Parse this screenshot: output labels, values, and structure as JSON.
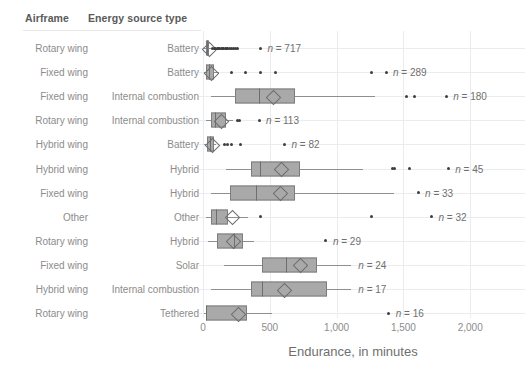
{
  "header": {
    "airframe_label": "Airframe",
    "energy_label": "Energy source type"
  },
  "axis": {
    "xlabel": "Endurance, in minutes",
    "ticks": [
      "0",
      "500",
      "1,000",
      "1,500",
      "2,000"
    ]
  },
  "rows": [
    {
      "airframe": "Rotary wing",
      "energy": "Battery",
      "n_label": "n = 717"
    },
    {
      "airframe": "Fixed wing",
      "energy": "Battery",
      "n_label": "n = 289"
    },
    {
      "airframe": "Fixed wing",
      "energy": "Internal combustion",
      "n_label": "n = 180"
    },
    {
      "airframe": "Rotary wing",
      "energy": "Internal combustion",
      "n_label": "n = 113"
    },
    {
      "airframe": "Hybrid wing",
      "energy": "Battery",
      "n_label": "n = 82"
    },
    {
      "airframe": "Hybrid wing",
      "energy": "Hybrid",
      "n_label": "n = 45"
    },
    {
      "airframe": "Fixed wing",
      "energy": "Hybrid",
      "n_label": "n = 33"
    },
    {
      "airframe": "Other",
      "energy": "Other",
      "n_label": "n = 32"
    },
    {
      "airframe": "Rotary wing",
      "energy": "Hybrid",
      "n_label": "n = 29"
    },
    {
      "airframe": "Fixed wing",
      "energy": "Solar",
      "n_label": "n = 24"
    },
    {
      "airframe": "Hybrid wing",
      "energy": "Internal combustion",
      "n_label": "n = 17"
    },
    {
      "airframe": "Rotary wing",
      "energy": "Tethered",
      "n_label": "n = 16"
    }
  ],
  "chart_data": {
    "type": "box",
    "title": "",
    "xlabel": "Endurance, in minutes",
    "ylabel": "",
    "xlim": [
      0,
      2150
    ],
    "xticks": [
      0,
      500,
      1000,
      1500,
      2000
    ],
    "grid": "vertical",
    "legend": "none",
    "colors": {
      "box_fill": "#a9a9a9",
      "box_edge": "#7d7d7d",
      "median": "#6e6e6e",
      "whisker": "#8f8f8f",
      "outlier": "#3d3d3d",
      "grid": "#ececec",
      "text": "#8c8c8c"
    },
    "categories": [
      "Rotary wing / Battery",
      "Fixed wing / Battery",
      "Fixed wing / Internal combustion",
      "Rotary wing / Internal combustion",
      "Hybrid wing / Battery",
      "Hybrid wing / Hybrid",
      "Fixed wing / Hybrid",
      "Other / Other",
      "Rotary wing / Hybrid",
      "Fixed wing / Solar",
      "Hybrid wing / Internal combustion",
      "Rotary wing / Tethered"
    ],
    "boxes": [
      {
        "category": "Rotary wing / Battery",
        "n": 717,
        "whisker_low": 2,
        "q1": 20,
        "median": 30,
        "mean": 38,
        "q3": 45,
        "whisker_high": 60,
        "outliers": [
          70,
          85,
          95,
          105,
          115,
          125,
          135,
          145,
          155,
          165,
          175,
          185,
          200,
          215,
          230,
          245,
          260,
          430
        ]
      },
      {
        "category": "Fixed wing / Battery",
        "n": 289,
        "whisker_low": 5,
        "q1": 25,
        "median": 45,
        "mean": 55,
        "q3": 80,
        "whisker_high": 120,
        "outliers": [
          210,
          320,
          430,
          545,
          1260,
          1370
        ]
      },
      {
        "category": "Fixed wing / Internal combustion",
        "n": 180,
        "whisker_low": 60,
        "q1": 240,
        "median": 420,
        "mean": 520,
        "q3": 690,
        "whisker_high": 1290,
        "outliers": [
          1520,
          1580,
          1820
        ]
      },
      {
        "category": "Rotary wing / Internal combustion",
        "n": 113,
        "whisker_low": 20,
        "q1": 60,
        "median": 90,
        "mean": 130,
        "q3": 170,
        "whisker_high": 225,
        "outliers": [
          255,
          270,
          420
        ]
      },
      {
        "category": "Hybrid wing / Battery",
        "n": 82,
        "whisker_low": 5,
        "q1": 30,
        "median": 50,
        "mean": 62,
        "q3": 80,
        "whisker_high": 100,
        "outliers": [
          160,
          185,
          210,
          280,
          610
        ]
      },
      {
        "category": "Hybrid wing / Hybrid",
        "n": 45,
        "whisker_low": 175,
        "q1": 360,
        "median": 430,
        "mean": 580,
        "q3": 730,
        "whisker_high": 1200,
        "outliers": [
          1420,
          1430,
          1545,
          1835
        ]
      },
      {
        "category": "Fixed wing / Hybrid",
        "n": 33,
        "whisker_low": 60,
        "q1": 200,
        "median": 400,
        "mean": 575,
        "q3": 690,
        "whisker_high": 1430,
        "outliers": [
          1610
        ]
      },
      {
        "category": "Other / Other",
        "n": 32,
        "whisker_low": 20,
        "q1": 60,
        "median": 100,
        "mean": 215,
        "q3": 190,
        "whisker_high": 340,
        "outliers": [
          430,
          1260,
          1710
        ]
      },
      {
        "category": "Rotary wing / Hybrid",
        "n": 29,
        "whisker_low": 40,
        "q1": 105,
        "median": 230,
        "mean": 220,
        "q3": 300,
        "whisker_high": 380,
        "outliers": [
          920
        ]
      },
      {
        "category": "Fixed wing / Solar",
        "n": 24,
        "whisker_low": 160,
        "q1": 440,
        "median": 620,
        "mean": 720,
        "q3": 850,
        "whisker_high": 1110,
        "outliers": []
      },
      {
        "category": "Hybrid wing / Internal combustion",
        "n": 17,
        "whisker_low": 60,
        "q1": 360,
        "median": 440,
        "mean": 600,
        "q3": 930,
        "whisker_high": 1110,
        "outliers": []
      },
      {
        "category": "Rotary wing / Tethered",
        "n": 16,
        "whisker_low": 10,
        "q1": 20,
        "median": 20,
        "mean": 260,
        "q3": 330,
        "whisker_high": 520,
        "outliers": [
          1390
        ]
      }
    ]
  }
}
